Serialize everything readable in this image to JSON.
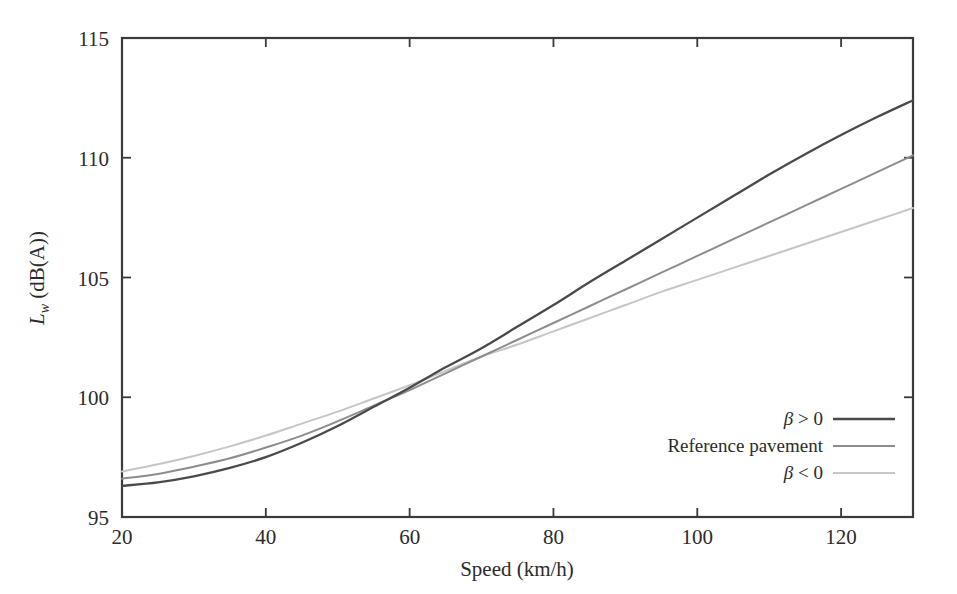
{
  "figure": {
    "background_color": "#ffffff",
    "frame_color": "#3a3a3a",
    "text_color": "#2b2b2b"
  },
  "axes": {
    "x_title": "Speed (km/h)",
    "y_title_main": "L",
    "y_title_sub": "w",
    "y_title_rest": " (dB(A))",
    "x_ticks": [
      "20",
      "40",
      "60",
      "80",
      "100",
      "120"
    ],
    "y_ticks": [
      "115",
      "110",
      "105",
      "100",
      "95"
    ]
  },
  "legend": {
    "entries": [
      {
        "label_prefix": "β",
        "label_rest": " > 0",
        "label_full": "β > 0",
        "color": "#4a4a4a"
      },
      {
        "label_prefix": "",
        "label_rest": "Reference pavement",
        "label_full": "Reference pavement",
        "color": "#8d8d8d"
      },
      {
        "label_prefix": "β",
        "label_rest": " < 0",
        "label_full": "β < 0",
        "color": "#c6c6c6"
      }
    ]
  },
  "chart_data": {
    "type": "line",
    "title": "",
    "xlabel": "Speed (km/h)",
    "ylabel": "Lw (dB(A))",
    "xlim": [
      20,
      130
    ],
    "ylim": [
      95,
      115
    ],
    "xticks": [
      20,
      40,
      60,
      80,
      100,
      120
    ],
    "yticks": [
      95,
      100,
      105,
      110,
      115
    ],
    "grid": false,
    "legend_position": "lower-right",
    "annotations": [
      "All three curves intersect near (70 km/h, 102 dB(A))"
    ],
    "x": [
      20,
      25,
      30,
      35,
      40,
      45,
      50,
      55,
      60,
      65,
      70,
      75,
      80,
      85,
      90,
      95,
      100,
      105,
      110,
      115,
      120,
      125,
      130
    ],
    "series": [
      {
        "name": "β > 0",
        "color": "#4a4a4a",
        "width": 2.3,
        "values": [
          96.3,
          96.45,
          96.7,
          97.05,
          97.5,
          98.1,
          98.8,
          99.6,
          100.4,
          101.25,
          102.05,
          102.95,
          103.85,
          104.8,
          105.7,
          106.6,
          107.5,
          108.4,
          109.3,
          110.15,
          110.95,
          111.7,
          112.4
        ]
      },
      {
        "name": "Reference pavement",
        "color": "#8d8d8d",
        "width": 2.0,
        "values": [
          96.6,
          96.8,
          97.1,
          97.45,
          97.9,
          98.4,
          99.0,
          99.65,
          100.3,
          101.0,
          101.7,
          102.4,
          103.1,
          103.8,
          104.5,
          105.2,
          105.9,
          106.6,
          107.3,
          108.0,
          108.7,
          109.4,
          110.1
        ]
      },
      {
        "name": "β < 0",
        "color": "#c6c6c6",
        "width": 2.0,
        "values": [
          96.9,
          97.2,
          97.55,
          97.95,
          98.4,
          98.9,
          99.4,
          99.95,
          100.5,
          101.1,
          101.7,
          102.2,
          102.75,
          103.3,
          103.85,
          104.4,
          104.9,
          105.4,
          105.9,
          106.4,
          106.9,
          107.4,
          107.9
        ]
      }
    ]
  }
}
